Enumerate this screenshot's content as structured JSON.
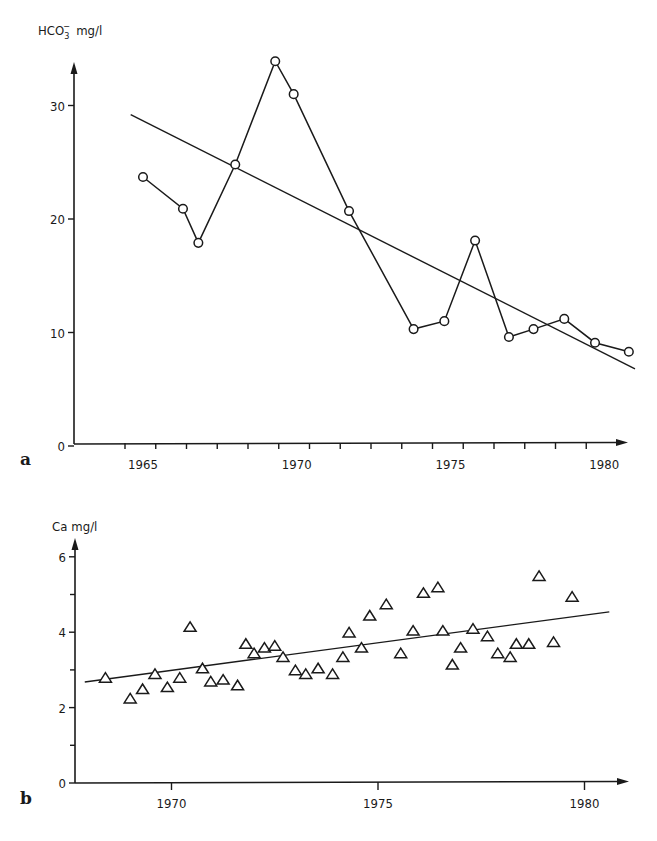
{
  "figure": {
    "panels": [
      {
        "id": "a",
        "panel_label": "a",
        "ylabel_main": "HCO",
        "ylabel_sub": "3",
        "ylabel_sup": "−",
        "ylabel_unit": "mg/l",
        "y_ticks": [
          {
            "value": 0,
            "label": "0"
          },
          {
            "value": 10,
            "label": "10"
          },
          {
            "value": 20,
            "label": "20"
          },
          {
            "value": 30,
            "label": "30"
          }
        ],
        "x_labels": [
          {
            "value": 1965,
            "label": "1965"
          },
          {
            "value": 1970,
            "label": "1970"
          },
          {
            "value": 1975,
            "label": "1975"
          },
          {
            "value": 1980,
            "label": "1980"
          }
        ]
      },
      {
        "id": "b",
        "panel_label": "b",
        "ylabel_main": "Ca",
        "ylabel_unit": "mg/l",
        "y_ticks": [
          {
            "value": 0,
            "label": "0"
          },
          {
            "value": 2,
            "label": "2"
          },
          {
            "value": 4,
            "label": "4"
          },
          {
            "value": 6,
            "label": "6"
          }
        ],
        "x_labels": [
          {
            "value": 1970,
            "label": "1970"
          },
          {
            "value": 1975,
            "label": "1975"
          },
          {
            "value": 1980,
            "label": "1980"
          }
        ]
      }
    ]
  },
  "chart_data": [
    {
      "type": "line",
      "panel": "a",
      "title": "",
      "xlabel": "",
      "ylabel": "HCO3− mg/l",
      "xlim": [
        1962.9,
        1981.6
      ],
      "ylim": [
        0,
        33
      ],
      "y_ticks": [
        0,
        10,
        20,
        30
      ],
      "y_minor_ticks": [],
      "x_tick_labels": [
        "1965",
        "1970",
        "1975",
        "1980"
      ],
      "x_minor_ticks_per_year": true,
      "grid": false,
      "legend": null,
      "series": [
        {
          "name": "HCO3− observed",
          "marker": "open-circle",
          "connected": true,
          "x": [
            1965.0,
            1966.3,
            1966.8,
            1968.0,
            1969.3,
            1969.9,
            1971.7,
            1973.8,
            1974.8,
            1975.8,
            1976.9,
            1977.7,
            1978.7,
            1979.7,
            1980.8
          ],
          "y": [
            23.7,
            20.9,
            17.9,
            24.8,
            33.9,
            31.0,
            20.7,
            10.3,
            11.0,
            18.1,
            9.6,
            10.3,
            11.2,
            9.1,
            8.3
          ]
        },
        {
          "name": "linear trend",
          "marker": "none",
          "connected": true,
          "x": [
            1964.6,
            1981.0
          ],
          "y": [
            29.2,
            6.8
          ]
        }
      ]
    },
    {
      "type": "scatter",
      "panel": "b",
      "title": "",
      "xlabel": "",
      "ylabel": "Ca mg/l",
      "xlim": [
        1967.4,
        1981.0
      ],
      "ylim": [
        0,
        6.4
      ],
      "y_ticks": [
        0,
        2,
        4,
        6
      ],
      "y_minor_ticks": [
        1,
        3,
        5
      ],
      "x_tick_labels": [
        "1970",
        "1975",
        "1980"
      ],
      "grid": false,
      "legend": null,
      "series": [
        {
          "name": "Ca observed",
          "marker": "open-triangle",
          "connected": false,
          "x": [
            1968.4,
            1969.0,
            1969.3,
            1969.6,
            1969.9,
            1970.2,
            1970.45,
            1970.75,
            1970.95,
            1971.25,
            1971.6,
            1971.8,
            1972.0,
            1972.25,
            1972.5,
            1972.7,
            1973.0,
            1973.25,
            1973.55,
            1973.9,
            1974.15,
            1974.3,
            1974.6,
            1974.8,
            1975.2,
            1975.55,
            1975.85,
            1976.1,
            1976.45,
            1976.57,
            1976.8,
            1977.0,
            1977.3,
            1977.65,
            1977.9,
            1978.2,
            1978.35,
            1978.65,
            1978.9,
            1979.25,
            1979.7
          ],
          "y": [
            2.8,
            2.25,
            2.5,
            2.9,
            2.55,
            2.8,
            4.15,
            3.05,
            2.7,
            2.75,
            2.6,
            3.7,
            3.45,
            3.6,
            3.65,
            3.35,
            3.0,
            2.9,
            3.05,
            2.9,
            3.35,
            4.0,
            3.6,
            4.45,
            4.75,
            3.45,
            4.05,
            5.05,
            5.2,
            4.05,
            3.15,
            3.6,
            4.1,
            3.9,
            3.45,
            3.35,
            3.7,
            3.7,
            5.5,
            3.75,
            4.95
          ]
        },
        {
          "name": "linear trend",
          "marker": "none",
          "connected": true,
          "x": [
            1967.9,
            1980.6
          ],
          "y": [
            2.68,
            4.54
          ]
        }
      ]
    }
  ]
}
